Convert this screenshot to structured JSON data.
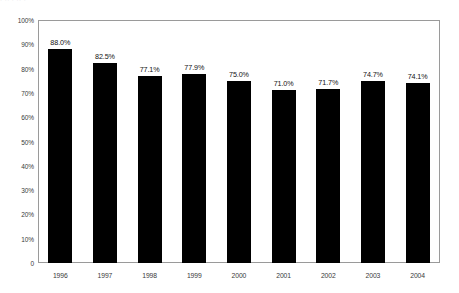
{
  "page": {
    "background_color": "#ffffff",
    "top_artifact_text": "· ·· · ·· ·"
  },
  "chart_data": {
    "type": "bar",
    "title": "",
    "subtitle": "",
    "xlabel": "",
    "ylabel": "",
    "categories": [
      "1996",
      "1997",
      "1998",
      "1999",
      "2000",
      "2001",
      "2002",
      "2003",
      "2004"
    ],
    "values": [
      88.0,
      82.5,
      77.1,
      77.9,
      75.0,
      71.0,
      71.7,
      74.7,
      74.1
    ],
    "data_labels": [
      "88.0%",
      "82.5%",
      "77.1%",
      "77.9%",
      "75.0%",
      "71.0%",
      "71.7%",
      "74.7%",
      "74.1%"
    ],
    "series": [
      {
        "name": "",
        "values": [
          88.0,
          82.5,
          77.1,
          77.9,
          75.0,
          71.0,
          71.7,
          74.7,
          74.1
        ]
      }
    ],
    "ylim": [
      0,
      100
    ],
    "ytick_values": [
      100,
      90,
      80,
      70,
      60,
      50,
      40,
      30,
      20,
      10,
      0
    ],
    "ytick_labels": [
      "100%",
      "90%",
      "80%",
      "70%",
      "60%",
      "50%",
      "40%",
      "30%",
      "20%",
      "10%",
      "0"
    ],
    "grid": false,
    "legend": null,
    "legend_position": "none",
    "bar_color": "#000000",
    "plot_border_color": "#9a9a9a",
    "annotations": []
  }
}
